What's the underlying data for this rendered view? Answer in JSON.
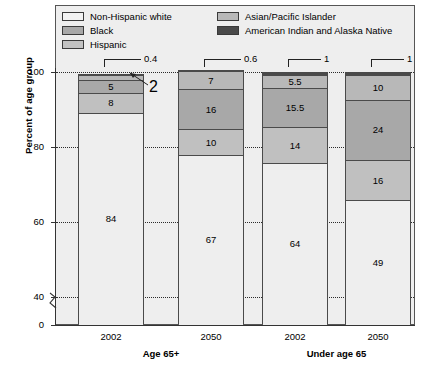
{
  "chart_data": {
    "type": "bar",
    "subtype": "stacked-vertical-percent",
    "title": "",
    "xlabel": "",
    "ylabel": "Percent of age group",
    "ylim": [
      0,
      100
    ],
    "y_ticks": [
      "0",
      "40",
      "60",
      "80",
      "100"
    ],
    "y_axis_break": true,
    "grid": "horizontal-dotted",
    "legend_position": "top-inside",
    "categories": [
      "2002",
      "2050",
      "2002",
      "2050"
    ],
    "groups": [
      {
        "label": "Age 65+",
        "categories": [
          "2002",
          "2050"
        ]
      },
      {
        "label": "Under age 65",
        "categories": [
          "2002",
          "2050"
        ]
      }
    ],
    "series": [
      {
        "name": "Non-Hispanic white",
        "color": "#eeeeee",
        "values": [
          84,
          67,
          64,
          49
        ]
      },
      {
        "name": "Hispanic",
        "color": "#c0c0c0",
        "values": [
          8,
          10,
          14,
          16
        ]
      },
      {
        "name": "Black",
        "color": "#a8a8a8",
        "values": [
          5,
          16,
          15.5,
          24
        ]
      },
      {
        "name": "Asian/Pacific Islander",
        "color": "#b8b8b8",
        "values": [
          2,
          7,
          5.5,
          10
        ]
      },
      {
        "name": "American Indian and Alaska Native",
        "color": "#4a4a4a",
        "values": [
          0.4,
          0.6,
          1,
          1
        ]
      }
    ],
    "annotations": [
      {
        "text": "0.4",
        "series": "American Indian and Alaska Native",
        "bar": 0
      },
      {
        "text": "2",
        "series": "Asian/Pacific Islander",
        "bar": 0
      },
      {
        "text": "0.6",
        "series": "American Indian and Alaska Native",
        "bar": 1
      },
      {
        "text": "1",
        "series": "American Indian and Alaska Native",
        "bar": 2
      },
      {
        "text": "1",
        "series": "American Indian and Alaska Native",
        "bar": 3
      }
    ]
  },
  "legend": {
    "left_items": [
      {
        "label": "Non-Hispanic white",
        "color": "#f2f2f2"
      },
      {
        "label": "Black",
        "color": "#a8a8a8"
      },
      {
        "label": "Hispanic",
        "color": "#c2c2c2"
      }
    ],
    "right_items": [
      {
        "label": "Asian/Pacific Islander",
        "color": "#b8b8b8"
      },
      {
        "label": "American Indian and Alaska Native",
        "color": "#4a4a4a"
      }
    ]
  },
  "y_axis": {
    "title": "Percent of age group",
    "ticks": [
      {
        "label": "100"
      },
      {
        "label": "80"
      },
      {
        "label": "60"
      },
      {
        "label": "40"
      },
      {
        "label": "0"
      }
    ]
  },
  "x_axis": {
    "ticks": [
      {
        "label": "2002"
      },
      {
        "label": "2050"
      },
      {
        "label": "2002"
      },
      {
        "label": "2050"
      }
    ],
    "groups": [
      {
        "label": "Age 65+"
      },
      {
        "label": "Under age 65"
      }
    ]
  },
  "bars": [
    {
      "name": "bar-age65plus-2002",
      "segments": [
        {
          "series": "American Indian and Alaska Native",
          "value": 0.4,
          "label": ""
        },
        {
          "series": "Asian/Pacific Islander",
          "value": 2,
          "label": ""
        },
        {
          "series": "Black",
          "value": 5,
          "label": "5"
        },
        {
          "series": "Hispanic",
          "value": 8,
          "label": "8"
        },
        {
          "series": "Non-Hispanic white",
          "value": 84,
          "label": "84"
        }
      ],
      "callouts": [
        {
          "text": "0.4"
        },
        {
          "text": "2"
        }
      ]
    },
    {
      "name": "bar-age65plus-2050",
      "segments": [
        {
          "series": "American Indian and Alaska Native",
          "value": 0.6,
          "label": ""
        },
        {
          "series": "Asian/Pacific Islander",
          "value": 7,
          "label": "7"
        },
        {
          "series": "Black",
          "value": 16,
          "label": "16"
        },
        {
          "series": "Hispanic",
          "value": 10,
          "label": "10"
        },
        {
          "series": "Non-Hispanic white",
          "value": 67,
          "label": "67"
        }
      ],
      "callouts": [
        {
          "text": "0.6"
        }
      ]
    },
    {
      "name": "bar-under65-2002",
      "segments": [
        {
          "series": "American Indian and Alaska Native",
          "value": 1,
          "label": ""
        },
        {
          "series": "Asian/Pacific Islander",
          "value": 5.5,
          "label": "5.5"
        },
        {
          "series": "Black",
          "value": 15.5,
          "label": "15.5"
        },
        {
          "series": "Hispanic",
          "value": 14,
          "label": "14"
        },
        {
          "series": "Non-Hispanic white",
          "value": 64,
          "label": "64"
        }
      ],
      "callouts": [
        {
          "text": "1"
        }
      ]
    },
    {
      "name": "bar-under65-2050",
      "segments": [
        {
          "series": "American Indian and Alaska Native",
          "value": 1,
          "label": ""
        },
        {
          "series": "Asian/Pacific Islander",
          "value": 10,
          "label": "10"
        },
        {
          "series": "Black",
          "value": 24,
          "label": "24"
        },
        {
          "series": "Hispanic",
          "value": 16,
          "label": "16"
        },
        {
          "series": "Non-Hispanic white",
          "value": 49,
          "label": "49"
        }
      ],
      "callouts": [
        {
          "text": "1"
        }
      ]
    }
  ]
}
